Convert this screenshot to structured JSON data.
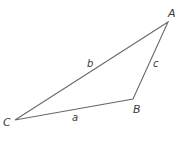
{
  "diagram": {
    "type": "triangle",
    "vertices": [
      {
        "label": "A",
        "x": 168,
        "y": 22
      },
      {
        "label": "B",
        "x": 133,
        "y": 99
      },
      {
        "label": "C",
        "x": 15,
        "y": 120
      }
    ],
    "sides": [
      {
        "label": "a",
        "between": [
          "B",
          "C"
        ]
      },
      {
        "label": "b",
        "between": [
          "A",
          "C"
        ]
      },
      {
        "label": "c",
        "between": [
          "A",
          "B"
        ]
      }
    ],
    "stroke_color": "#6a6a6a",
    "label_color": "#3a3a3a"
  }
}
